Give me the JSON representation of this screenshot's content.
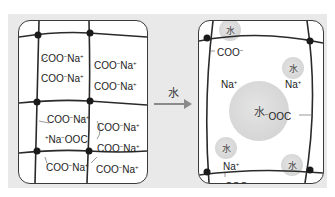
{
  "diagram": {
    "title": "",
    "arrow": {
      "label": "水"
    },
    "left_panel": {
      "description": "dry polymer network with carboxylate sodium salt groups",
      "labels": [
        {
          "text": "COO",
          "charge": "−",
          "counter": "Na",
          "counter_charge": "+"
        },
        {
          "text": "COO",
          "charge": "−",
          "counter": "Na",
          "counter_charge": "+"
        },
        {
          "text": "COO",
          "charge": "−",
          "counter": "Na",
          "counter_charge": "+"
        },
        {
          "text": "COO",
          "charge": "−",
          "counter": "Na",
          "counter_charge": "+"
        },
        {
          "text": "COO",
          "charge": "−",
          "counter": "Na",
          "counter_charge": "+"
        },
        {
          "text": "COO",
          "charge": "−",
          "counter": "Na",
          "counter_charge": "+"
        },
        {
          "text": "COO",
          "charge": "−",
          "counter": "Na",
          "counter_charge": "+"
        },
        {
          "text": "COO",
          "charge": "−",
          "counter": "Na",
          "counter_charge": "+"
        },
        {
          "text": "COO",
          "charge": "−",
          "counter": "Na",
          "counter_charge": "+"
        }
      ],
      "reverse_label": {
        "prefix_charge": "+",
        "counter": "Na",
        "charge": "−",
        "text": "OOC"
      }
    },
    "right_panel": {
      "description": "swollen network with water",
      "water_label": "水",
      "coo_labels": [
        "COO",
        "COO"
      ],
      "ooc_label": "OOC",
      "na_labels": [
        "Na",
        "Na",
        "Na"
      ],
      "charge_minus": "−",
      "charge_plus": "+"
    }
  },
  "colors": {
    "background": "#e9e9e9",
    "box_fill": "#ffffff",
    "line": "#2a2a2a",
    "water": "#d4d4d4",
    "arrow": "#8a8a8a"
  }
}
